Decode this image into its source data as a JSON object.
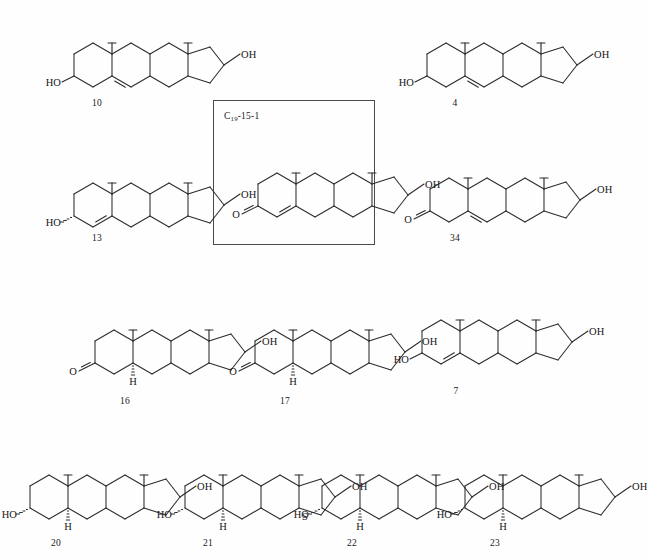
{
  "figure": {
    "kind": "chemical-structure-panel",
    "background_color": "#fefefe",
    "line_color": "#2b2b2b",
    "width": 614,
    "height": 557,
    "reference_box": {
      "label_prefix": "C",
      "label_subscript": "19",
      "label_suffix": "-15-1",
      "full_label": "C19-15-1",
      "x": 213,
      "y": 100,
      "width": 162,
      "height": 145
    },
    "compounds": [
      {
        "number": "10",
        "x": 52,
        "y": 8,
        "scale": 1.0,
        "label_x": 97,
        "label_y": 98,
        "ring_a_unsaturation": "delta-5",
        "c3_substituent": "HO",
        "c3_label": "HO",
        "c17_substituent": "OH",
        "c17_label": "OH",
        "c3_bond_style": "plain",
        "c17_bond_style": "plain",
        "c5_hydrogen": "none",
        "extra_marker": "none"
      },
      {
        "number": "4",
        "x": 405,
        "y": 8,
        "scale": 1.0,
        "label_x": 455,
        "label_y": 98,
        "ring_a_unsaturation": "delta-5",
        "c3_substituent": "HO",
        "c3_label": "HO",
        "c17_substituent": "OH",
        "c17_label": "OH",
        "c3_bond_style": "plain",
        "c17_bond_style": "plain",
        "c5_hydrogen": "none",
        "extra_marker": "none"
      },
      {
        "number": "13",
        "x": 52,
        "y": 148,
        "scale": 1.0,
        "label_x": 97,
        "label_y": 233,
        "ring_a_unsaturation": "delta-4",
        "c3_substituent": "HO",
        "c3_label": "HO",
        "c17_substituent": "OH",
        "c17_label": "OH",
        "c3_bond_style": "hash",
        "c17_bond_style": "plain",
        "c5_hydrogen": "none",
        "extra_marker": "none"
      },
      {
        "number": "34",
        "x": 408,
        "y": 143,
        "scale": 1.0,
        "label_x": 455,
        "label_y": 233,
        "ring_a_unsaturation": "delta-5-ene-3-one",
        "c3_substituent": "O",
        "c3_label": "O",
        "c17_substituent": "OH",
        "c17_label": "OH",
        "c3_bond_style": "double",
        "c17_bond_style": "plain",
        "c5_hydrogen": "none",
        "extra_marker": "none"
      },
      {
        "number": "16",
        "x": 73,
        "y": 295,
        "scale": 1.0,
        "label_x": 125,
        "label_y": 396,
        "ring_a_unsaturation": "saturated",
        "c3_substituent": "O",
        "c3_label": "O",
        "c17_substituent": "OH",
        "c17_label": "OH",
        "c3_bond_style": "double",
        "c17_bond_style": "plain",
        "c5_hydrogen": "H",
        "extra_marker": "none"
      },
      {
        "number": "17",
        "x": 233,
        "y": 295,
        "scale": 1.0,
        "label_x": 285,
        "label_y": 396,
        "ring_a_unsaturation": "saturated",
        "c3_substituent": "O",
        "c3_label": "O",
        "c17_substituent": "OH",
        "c17_label": "OH",
        "c3_bond_style": "double",
        "c17_bond_style": "plain",
        "c5_hydrogen": "H",
        "extra_marker": "none"
      },
      {
        "number": "7",
        "x": 400,
        "y": 285,
        "scale": 1.0,
        "label_x": 456,
        "label_y": 386,
        "ring_a_unsaturation": "delta-4",
        "c3_substituent": "HO",
        "c3_label": "HO",
        "c17_substituent": "OH",
        "c17_label": "OH",
        "c3_bond_style": "plain",
        "c17_bond_style": "plain",
        "c5_hydrogen": "none",
        "extra_marker": "none"
      },
      {
        "number": "20",
        "x": 8,
        "y": 440,
        "scale": 1.0,
        "label_x": 56,
        "label_y": 538,
        "ring_a_unsaturation": "saturated",
        "c3_substituent": "HO",
        "c3_label": "HO",
        "c17_substituent": "OH",
        "c17_label": "OH",
        "c3_bond_style": "hash",
        "c17_bond_style": "plain",
        "c5_hydrogen": "H",
        "extra_marker": "none"
      },
      {
        "number": "21",
        "x": 163,
        "y": 440,
        "scale": 1.0,
        "label_x": 208,
        "label_y": 538,
        "ring_a_unsaturation": "saturated",
        "c3_substituent": "HO",
        "c3_label": "HO",
        "c17_substituent": "OH",
        "c17_label": "OH",
        "c3_bond_style": "hash",
        "c17_bond_style": "plain",
        "c5_hydrogen": "H",
        "extra_marker": "S"
      },
      {
        "number": "22",
        "x": 300,
        "y": 440,
        "scale": 1.0,
        "label_x": 352,
        "label_y": 538,
        "ring_a_unsaturation": "saturated",
        "c3_substituent": "HO",
        "c3_label": "HO",
        "c17_substituent": "OH",
        "c17_label": "OH",
        "c3_bond_style": "hash",
        "c17_bond_style": "plain",
        "c5_hydrogen": "H",
        "extra_marker": "none"
      },
      {
        "number": "23",
        "x": 443,
        "y": 440,
        "scale": 1.0,
        "label_x": 495,
        "label_y": 538,
        "ring_a_unsaturation": "saturated",
        "c3_substituent": "HO",
        "c3_label": "HO",
        "c17_substituent": "OH",
        "c17_label": "OH",
        "c3_bond_style": "hash",
        "c17_bond_style": "plain",
        "c5_hydrogen": "H",
        "extra_marker": "none"
      }
    ],
    "reference_compound": {
      "number": "",
      "x": 236,
      "y": 138,
      "scale": 1.0,
      "ring_a_unsaturation": "delta-4-ene-3-one",
      "c3_substituent": "O",
      "c3_label": "O",
      "c17_substituent": "OH",
      "c17_label": "OH",
      "c3_bond_style": "double",
      "c17_bond_style": "plain",
      "c5_hydrogen": "none",
      "extra_marker": "none"
    }
  }
}
